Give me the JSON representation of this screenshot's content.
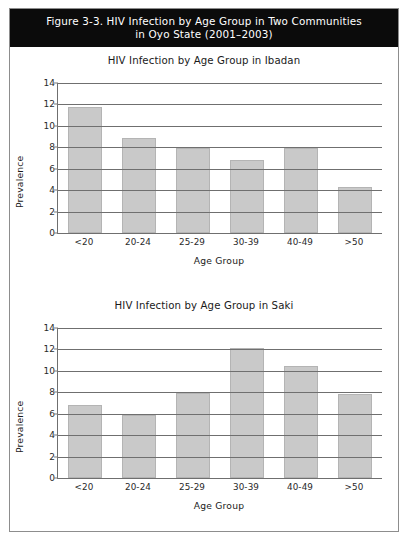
{
  "figure": {
    "caption": "Figure 3-3. HIV Infection by Age Group in Two Communities\nin Oyo State (2001–2003)",
    "frame_color": "#8d8d8d",
    "caption_bg": "#0b0b0b",
    "caption_fg": "#ffffff"
  },
  "chart_data": [
    {
      "type": "bar",
      "id": "ibadan",
      "title": "HIV Infection by Age Group in Ibadan",
      "xlabel": "Age Group",
      "ylabel": "Prevalence",
      "categories": [
        "<20",
        "20-24",
        "25-29",
        "30-39",
        "40-49",
        ">50"
      ],
      "values": [
        11.8,
        8.9,
        7.9,
        6.8,
        7.9,
        4.3
      ],
      "ylim": [
        0,
        14
      ],
      "yticks": [
        0,
        2,
        4,
        6,
        8,
        10,
        12,
        14
      ],
      "grid": true,
      "legend": "none",
      "bar_color": "#c9c9c9"
    },
    {
      "type": "bar",
      "id": "saki",
      "title": "HIV Infection by Age Group in Saki",
      "xlabel": "Age Group",
      "ylabel": "Prevalence",
      "categories": [
        "<20",
        "20-24",
        "25-29",
        "30-39",
        "40-49",
        ">50"
      ],
      "values": [
        6.8,
        5.9,
        7.9,
        12.1,
        10.5,
        7.8
      ],
      "ylim": [
        0,
        14
      ],
      "yticks": [
        0,
        2,
        4,
        6,
        8,
        10,
        12,
        14
      ],
      "grid": true,
      "legend": "none",
      "bar_color": "#c9c9c9"
    }
  ]
}
